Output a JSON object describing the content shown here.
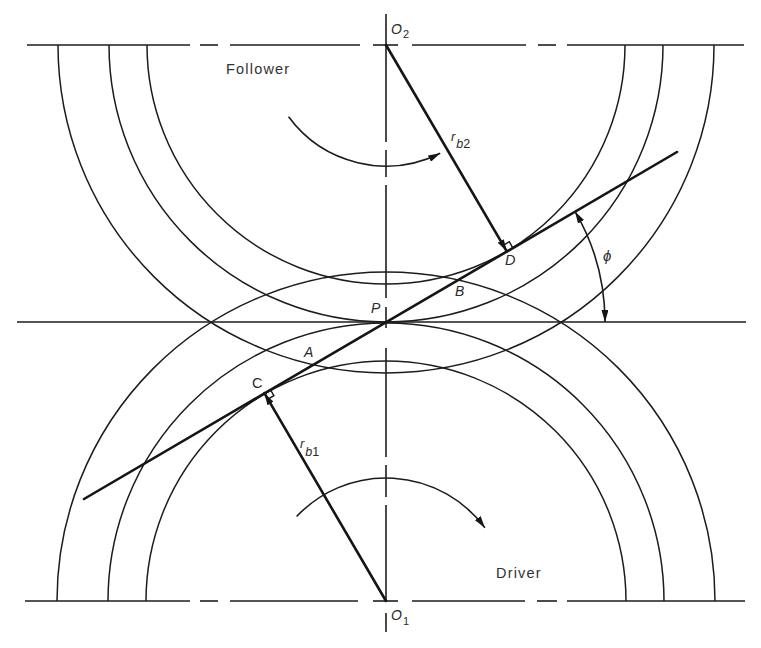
{
  "diagram": {
    "colors": {
      "ink": "#1c1c1c",
      "background": "#ffffff"
    },
    "labels": {
      "follower": "Follower",
      "driver": "Driver",
      "o2": {
        "base": "O",
        "sub": "2"
      },
      "o1": {
        "base": "O",
        "sub": "1"
      },
      "pitch_point": "P",
      "point_a": "A",
      "point_b": "B",
      "point_c": "C",
      "point_d": "D",
      "pressure_angle": "ϕ",
      "rb2": {
        "base": "r",
        "sub_letter": "b",
        "sub_index": "2"
      },
      "rb1": {
        "base": "r",
        "sub_letter": "b",
        "sub_index": "1"
      }
    }
  }
}
